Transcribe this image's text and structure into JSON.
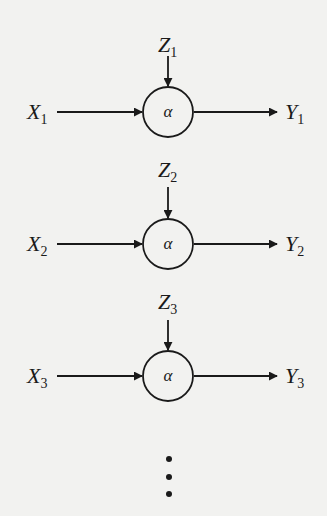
{
  "diagram": {
    "type": "repeated-node-chain",
    "background": "#f2f2f0",
    "stroke_color": "#1a1a1a",
    "nodes": [
      {
        "label": "α",
        "input": {
          "var": "X",
          "sub": "1"
        },
        "side_input": {
          "var": "Z",
          "sub": "1"
        },
        "output": {
          "var": "Y",
          "sub": "1"
        },
        "cy": 112
      },
      {
        "label": "α",
        "input": {
          "var": "X",
          "sub": "2"
        },
        "side_input": {
          "var": "Z",
          "sub": "2"
        },
        "output": {
          "var": "Y",
          "sub": "2"
        },
        "cy": 244
      },
      {
        "label": "α",
        "input": {
          "var": "X",
          "sub": "3"
        },
        "side_input": {
          "var": "Z",
          "sub": "3"
        },
        "output": {
          "var": "Y",
          "sub": "3"
        },
        "cy": 376
      }
    ],
    "continuation": "⋮"
  }
}
